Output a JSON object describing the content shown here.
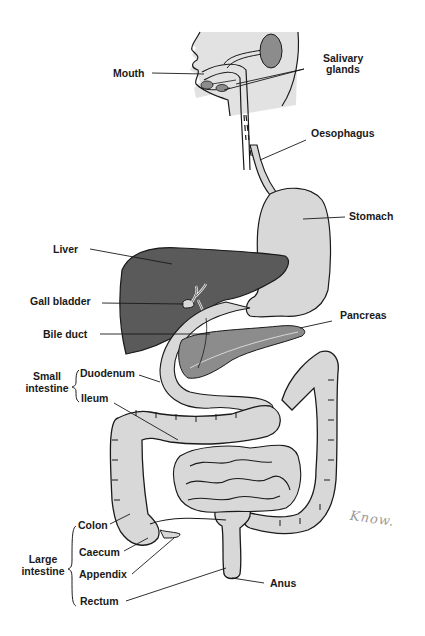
{
  "diagram": {
    "colors": {
      "background": "#ffffff",
      "outline": "#1a1a1a",
      "organ_fill": "#d8d8d8",
      "head_fill": "#e2e2e2",
      "liver_fill": "#5a5a5a",
      "gland_fill": "#8c8c8c",
      "label_text": "#1a1a1a",
      "handwriting": "#9a9a9a"
    },
    "labels": {
      "mouth": "Mouth",
      "salivary_glands_line1": "Salivary",
      "salivary_glands_line2": "glands",
      "oesophagus": "Oesophagus",
      "stomach": "Stomach",
      "liver": "Liver",
      "gall_bladder": "Gall bladder",
      "bile_duct": "Bile duct",
      "pancreas": "Pancreas",
      "duodenum": "Duodenum",
      "ileum": "Ileum",
      "colon": "Colon",
      "caecum": "Caecum",
      "appendix": "Appendix",
      "rectum": "Rectum",
      "anus": "Anus"
    },
    "groups": {
      "small_intestine_line1": "Small",
      "small_intestine_line2": "intestine",
      "large_intestine_line1": "Large",
      "large_intestine_line2": "intestine"
    },
    "annotation": {
      "handwritten": "Know."
    }
  }
}
